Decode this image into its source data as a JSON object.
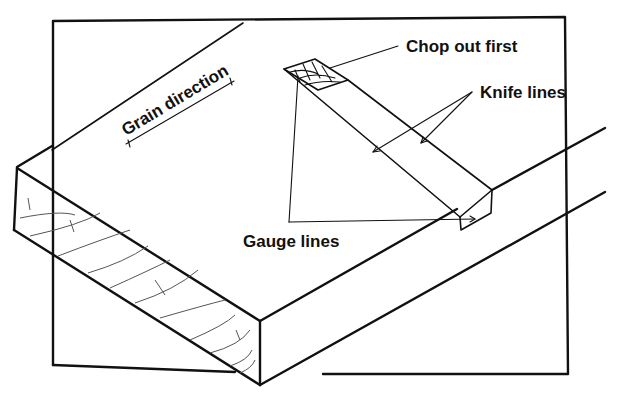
{
  "figure": {
    "background": "#ffffff",
    "ink_color": "#111111"
  },
  "labels": {
    "grain_direction": "Grain direction",
    "chop_out_first": "Chop out first",
    "knife_lines": "Knife lines",
    "gauge_lines": "Gauge lines"
  },
  "parts": {
    "backboard": "Background board (frame)",
    "workpiece": "Board with housing marked on top face",
    "end_grain": "End grain face with growth rings",
    "housing_slot": "Marked housing slot across board",
    "chop_region": "Cross-hatched waste area at back end"
  }
}
